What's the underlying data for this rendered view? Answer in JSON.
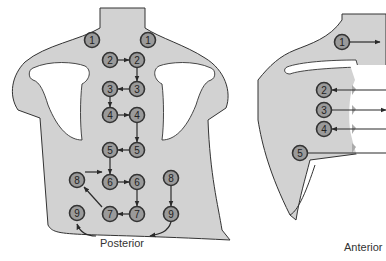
{
  "figure": {
    "posterior": {
      "caption": "Posterior",
      "points": [
        {
          "n": "1",
          "x": 92,
          "y": 40
        },
        {
          "n": "1",
          "x": 148,
          "y": 40
        },
        {
          "n": "2",
          "x": 110,
          "y": 60
        },
        {
          "n": "2",
          "x": 137,
          "y": 60
        },
        {
          "n": "3",
          "x": 110,
          "y": 89
        },
        {
          "n": "3",
          "x": 137,
          "y": 89
        },
        {
          "n": "4",
          "x": 110,
          "y": 115
        },
        {
          "n": "4",
          "x": 137,
          "y": 115
        },
        {
          "n": "5",
          "x": 110,
          "y": 150
        },
        {
          "n": "5",
          "x": 137,
          "y": 150
        },
        {
          "n": "8",
          "x": 77,
          "y": 180
        },
        {
          "n": "6",
          "x": 110,
          "y": 182
        },
        {
          "n": "6",
          "x": 137,
          "y": 182
        },
        {
          "n": "8",
          "x": 171,
          "y": 178
        },
        {
          "n": "9",
          "x": 77,
          "y": 213
        },
        {
          "n": "7",
          "x": 110,
          "y": 214
        },
        {
          "n": "7",
          "x": 137,
          "y": 214
        },
        {
          "n": "9",
          "x": 171,
          "y": 214
        }
      ]
    },
    "anterior": {
      "caption": "Anterior",
      "points": [
        {
          "n": "1",
          "x": 342,
          "y": 42
        },
        {
          "n": "2",
          "x": 324,
          "y": 90
        },
        {
          "n": "3",
          "x": 324,
          "y": 110
        },
        {
          "n": "4",
          "x": 324,
          "y": 129
        },
        {
          "n": "5",
          "x": 300,
          "y": 153
        }
      ]
    },
    "colors": {
      "skin": "#d2d2d2",
      "bone": "#ffffff",
      "outline": "#333333",
      "point_fill": "#9a9a9a",
      "arrow": "#2a2a2a"
    }
  }
}
